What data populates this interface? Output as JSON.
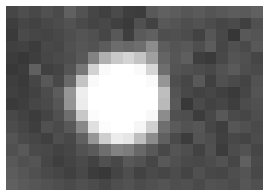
{
  "image": {
    "description": "Pixelated grayscale image of a bright white circular blob on a noisy dark gray background",
    "grid": {
      "cols": 22,
      "rows": 16
    },
    "pixels": [
      [
        70,
        78,
        72,
        80,
        74,
        96,
        82,
        70,
        64,
        74,
        62,
        60,
        88,
        96,
        92,
        86,
        90,
        84,
        88,
        92,
        90,
        96
      ],
      [
        62,
        70,
        66,
        72,
        76,
        82,
        74,
        68,
        72,
        64,
        58,
        80,
        66,
        88,
        84,
        78,
        82,
        76,
        70,
        74,
        64,
        80
      ],
      [
        58,
        74,
        70,
        68,
        72,
        78,
        84,
        80,
        70,
        88,
        62,
        90,
        96,
        78,
        80,
        76,
        66,
        86,
        72,
        54,
        88,
        84
      ],
      [
        64,
        66,
        60,
        72,
        70,
        80,
        86,
        82,
        92,
        108,
        104,
        110,
        140,
        92,
        84,
        88,
        78,
        92,
        70,
        80,
        74,
        88
      ],
      [
        60,
        56,
        62,
        70,
        74,
        78,
        88,
        130,
        176,
        200,
        212,
        196,
        160,
        100,
        86,
        94,
        62,
        58,
        72,
        84,
        80,
        70
      ],
      [
        56,
        60,
        96,
        64,
        68,
        84,
        120,
        210,
        250,
        255,
        255,
        250,
        214,
        110,
        84,
        80,
        76,
        72,
        82,
        90,
        78,
        74
      ],
      [
        62,
        58,
        70,
        88,
        72,
        104,
        196,
        250,
        255,
        255,
        255,
        255,
        250,
        150,
        78,
        70,
        88,
        64,
        80,
        74,
        68,
        82
      ],
      [
        64,
        60,
        66,
        76,
        92,
        150,
        238,
        255,
        255,
        255,
        255,
        255,
        255,
        190,
        84,
        72,
        66,
        70,
        64,
        58,
        70,
        84
      ],
      [
        58,
        62,
        70,
        74,
        86,
        148,
        236,
        255,
        255,
        255,
        255,
        255,
        255,
        186,
        88,
        56,
        74,
        66,
        70,
        62,
        76,
        80
      ],
      [
        72,
        66,
        60,
        68,
        80,
        110,
        200,
        252,
        255,
        255,
        255,
        255,
        248,
        140,
        80,
        78,
        60,
        72,
        88,
        74,
        70,
        78
      ],
      [
        76,
        70,
        62,
        80,
        74,
        88,
        136,
        224,
        252,
        255,
        255,
        246,
        208,
        110,
        90,
        82,
        86,
        70,
        62,
        86,
        80,
        74
      ],
      [
        84,
        74,
        70,
        64,
        78,
        72,
        96,
        150,
        206,
        236,
        230,
        190,
        140,
        96,
        74,
        60,
        84,
        78,
        64,
        72,
        68,
        76
      ],
      [
        80,
        88,
        74,
        72,
        66,
        70,
        82,
        90,
        110,
        130,
        124,
        104,
        88,
        72,
        84,
        78,
        66,
        80,
        60,
        76,
        82,
        70
      ],
      [
        88,
        80,
        84,
        70,
        62,
        68,
        74,
        66,
        80,
        72,
        88,
        82,
        70,
        88,
        80,
        74,
        72,
        76,
        82,
        70,
        96,
        74
      ],
      [
        92,
        86,
        80,
        74,
        70,
        64,
        72,
        60,
        56,
        68,
        78,
        66,
        74,
        70,
        76,
        68,
        80,
        72,
        70,
        78,
        84,
        72
      ],
      [
        96,
        90,
        86,
        82,
        78,
        74,
        80,
        76,
        70,
        78,
        82,
        76,
        80,
        84,
        78,
        80,
        74,
        82,
        80,
        76,
        86,
        80
      ]
    ]
  }
}
